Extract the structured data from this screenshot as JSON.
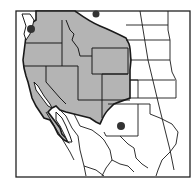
{
  "map": {
    "title": "Range map of western North America",
    "colors": {
      "background": "#ffffff",
      "range_fill": "#b4b4b4",
      "border_stroke": "#1a1a1a",
      "dot_fill": "#333333",
      "frame_stroke": "#222222"
    },
    "shaded_region": {
      "label": "distribution range",
      "states": [
        "Washington",
        "Oregon",
        "California",
        "Idaho",
        "Montana",
        "Nevada",
        "Utah",
        "Wyoming",
        "Colorado",
        "Arizona",
        "New Mexico"
      ]
    },
    "points": [
      {
        "label": "Puget Sound locality",
        "x": 31,
        "y": 29,
        "r": 4
      },
      {
        "label": "Northern border locality",
        "x": 96,
        "y": 14,
        "r": 3.5
      },
      {
        "label": "West Texas locality",
        "x": 121,
        "y": 126,
        "r": 4
      }
    ]
  }
}
